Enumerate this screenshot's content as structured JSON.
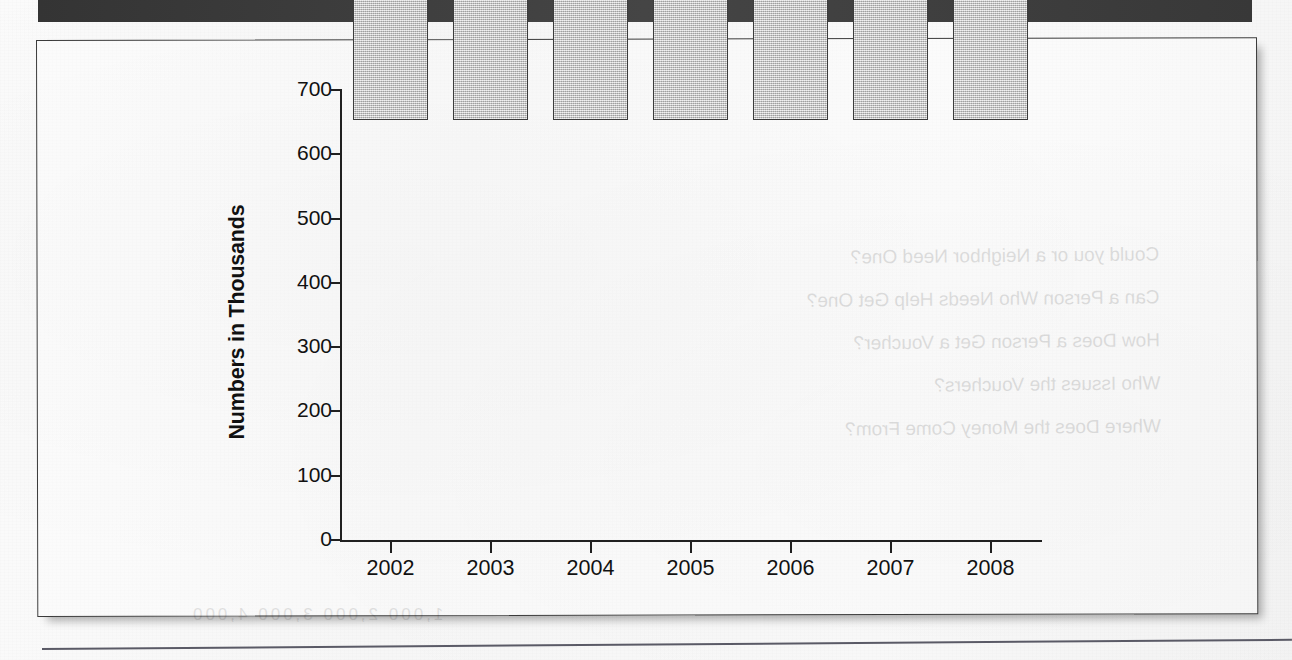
{
  "header": {
    "band_color": "#3a3a3a"
  },
  "figure": {
    "border_color": "#3b3b3b",
    "background": "#f8f8f8"
  },
  "bleed_through": {
    "line1": "Could you or a Neighbor Need One?",
    "line2": "Can a Person Who Needs Help Get One?",
    "line3": "How Does a Person Get a Voucher?",
    "line4": "Who Issues the Vouchers?",
    "line5": "Where Does the Money Come From?",
    "footer": "1,000  2,000   3,000   4,000"
  },
  "chart_data": {
    "type": "bar",
    "title": "",
    "xlabel": "",
    "ylabel": "Numbers in Thousands",
    "categories": [
      "2002",
      "2003",
      "2004",
      "2005",
      "2006",
      "2007",
      "2008"
    ],
    "values": [
      360,
      415,
      424,
      466,
      547,
      558,
      601
    ],
    "value_labels": [
      "360+",
      "415",
      "424",
      "466",
      "547",
      "558",
      "601"
    ],
    "ylim": [
      0,
      700
    ],
    "yticks": [
      0,
      100,
      200,
      300,
      400,
      500,
      600,
      700
    ],
    "ytick_labels": [
      "0",
      "100",
      "200",
      "300",
      "400",
      "500",
      "600",
      "700"
    ],
    "grid": false,
    "legend": false,
    "bar_fill": "#c9c9c9",
    "bar_edge": "#3c3c3c"
  }
}
